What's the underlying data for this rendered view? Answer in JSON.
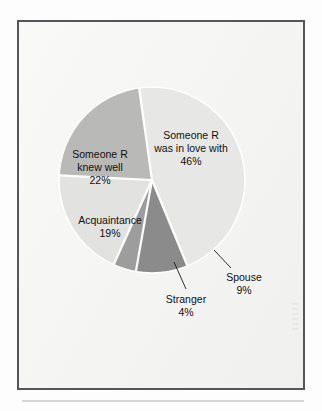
{
  "figure": {
    "frame_border_color": "#55555a",
    "paper_color": "#f2f2f0",
    "background_color": "#fdfdfd",
    "rule_color": "#d6d6d6"
  },
  "chart_data": {
    "type": "pie",
    "title": "",
    "subtitle": "",
    "xlabel": "",
    "ylabel": "",
    "legend_position": "none",
    "grid": false,
    "labels_inside": true,
    "total": 100,
    "units": "%",
    "center": {
      "cx": 152,
      "cy": 180,
      "r": 93
    },
    "start_angle_deg": -8,
    "direction": "clockwise",
    "categories": [
      "Someone R was in love with",
      "Spouse",
      "Stranger",
      "Acquaintance",
      "Someone R knew well"
    ],
    "values": [
      46,
      9,
      4,
      19,
      22
    ],
    "slices": [
      {
        "name": "someone-r-was-in-love-with",
        "label_line1": "Someone R",
        "label_line2": "was in love with",
        "value_label": "46%",
        "value": 46,
        "color": "#e7e7e5",
        "label_placement": "inside",
        "label_x": 191,
        "label_y": 139
      },
      {
        "name": "spouse",
        "label_line1": "Spouse",
        "label_line2": "",
        "value_label": "9%",
        "value": 9,
        "color": "#8b8b8b",
        "label_placement": "outside",
        "label_x": 244,
        "label_y": 281
      },
      {
        "name": "stranger",
        "label_line1": "Stranger",
        "label_line2": "",
        "value_label": "4%",
        "value": 4,
        "color": "#9d9d9d",
        "label_placement": "outside",
        "label_x": 186,
        "label_y": 303
      },
      {
        "name": "acquaintance",
        "label_line1": "Acquaintance",
        "label_line2": "",
        "value_label": "19%",
        "value": 19,
        "color": "#e2e2e0",
        "label_placement": "inside",
        "label_x": 110,
        "label_y": 224
      },
      {
        "name": "someone-r-knew-well",
        "label_line1": "Someone R",
        "label_line2": "knew well",
        "value_label": "22%",
        "value": 22,
        "color": "#b9b9b7",
        "label_placement": "inside",
        "label_x": 100,
        "label_y": 158
      }
    ]
  }
}
